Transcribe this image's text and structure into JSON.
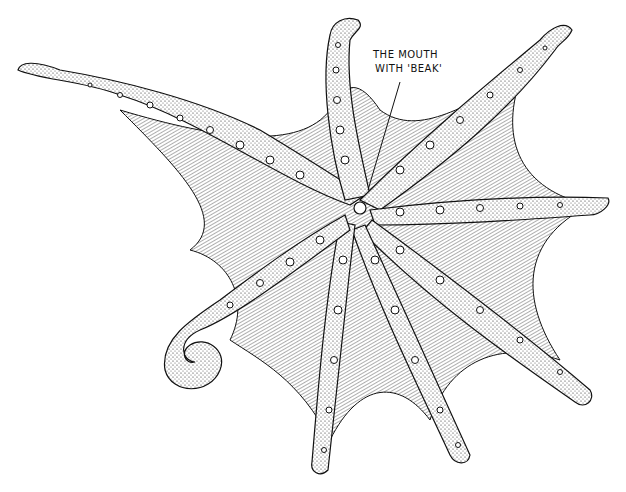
{
  "illustration": {
    "subject": "octopus-underside",
    "style": "pen-and-ink stipple",
    "ink_color": "#111111",
    "paper_color": "#ffffff",
    "center": [
      360,
      205
    ],
    "arms": [
      {
        "name": "arm-left-upper",
        "tip": [
          18,
          70
        ]
      },
      {
        "name": "arm-top",
        "tip": [
          350,
          22
        ]
      },
      {
        "name": "arm-top-right",
        "tip": [
          560,
          28
        ]
      },
      {
        "name": "arm-right",
        "tip": [
          608,
          205
        ]
      },
      {
        "name": "arm-right-lower",
        "tip": [
          590,
          400
        ]
      },
      {
        "name": "arm-bottom-right",
        "tip": [
          470,
          460
        ]
      },
      {
        "name": "arm-bottom",
        "tip": [
          325,
          470
        ]
      },
      {
        "name": "arm-left-curled",
        "tip": [
          185,
          310
        ]
      }
    ]
  },
  "annotation": {
    "line1": "THE MOUTH",
    "line2": "WITH 'BEAK'"
  }
}
